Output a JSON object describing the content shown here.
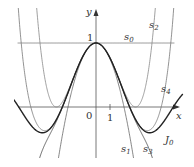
{
  "chart_data": {
    "type": "line",
    "title": "",
    "xlabel": "x",
    "ylabel": "y",
    "xlim": [
      -6.9,
      6.9
    ],
    "ylim": [
      -0.95,
      1.68
    ],
    "grid": false,
    "origin_label": "0",
    "x_ticks": [
      {
        "value": 1,
        "label": "1"
      }
    ],
    "y_ticks": [
      {
        "value": 1,
        "label": "1"
      }
    ],
    "series": [
      {
        "name": "s0",
        "label_main": "s",
        "label_sub": "0",
        "formula": "1",
        "color": "#777777",
        "width": 0.8
      },
      {
        "name": "s1",
        "label_main": "s",
        "label_sub": "1",
        "formula": "1 - x^2/4",
        "color": "#666666",
        "width": 0.8
      },
      {
        "name": "s2",
        "label_main": "s",
        "label_sub": "2",
        "formula": "1 - x^2/4 + x^4/64",
        "color": "#888888",
        "width": 0.8
      },
      {
        "name": "s3",
        "label_main": "s",
        "label_sub": "3",
        "formula": "1 - x^2/4 + x^4/64 - x^6/2304",
        "color": "#555555",
        "width": 0.9
      },
      {
        "name": "s4",
        "label_main": "s",
        "label_sub": "4",
        "formula": "1 - x^2/4 + x^4/64 - x^6/2304 + x^8/147456",
        "color": "#777777",
        "width": 0.8
      },
      {
        "name": "J0",
        "label_main": "J",
        "label_sub": "0",
        "formula": "Bessel J0(x)",
        "color": "#222222",
        "width": 1.4
      }
    ],
    "annotations": [
      "s0",
      "s1",
      "s2",
      "s3",
      "s4",
      "J0"
    ]
  },
  "labels": {
    "y_axis": "y",
    "x_axis": "x",
    "origin": "0",
    "x_one": "1",
    "y_one": "1",
    "s0_main": "s",
    "s0_sub": "0",
    "s1_main": "s",
    "s1_sub": "1",
    "s2_main": "s",
    "s2_sub": "2",
    "s3_main": "s",
    "s3_sub": "3",
    "s4_main": "s",
    "s4_sub": "4",
    "j0_main": "J",
    "j0_sub": "0"
  },
  "layout": {
    "origin_px": [
      96,
      107
    ],
    "px_per_unit_x": 14,
    "px_per_unit_y": 64
  }
}
